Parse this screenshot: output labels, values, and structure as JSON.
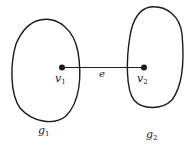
{
  "diagram": {
    "type": "graph-components-bridge",
    "components": [
      {
        "id": "g1",
        "label": "g",
        "subscript": "1"
      },
      {
        "id": "g2",
        "label": "g",
        "subscript": "2"
      }
    ],
    "vertices": [
      {
        "id": "v1",
        "label": "v",
        "subscript": "1",
        "component": "g1"
      },
      {
        "id": "v2",
        "label": "v",
        "subscript": "2",
        "component": "g2"
      }
    ],
    "edges": [
      {
        "id": "e",
        "label": "e",
        "from": "v1",
        "to": "v2"
      }
    ],
    "colors": {
      "stroke": "#1a1a1a",
      "background": "#ffffff"
    }
  }
}
